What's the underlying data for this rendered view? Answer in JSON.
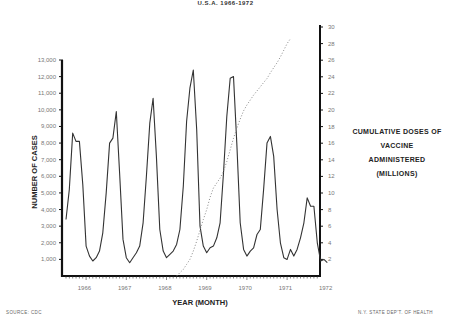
{
  "header": {
    "subtitle": "U.S.A. 1966-1972"
  },
  "footer": {
    "source": "SOURCE: CDC",
    "credit": "N.Y. STATE DEP'T. OF HEALTH"
  },
  "chart_data": {
    "type": "line",
    "title": "U.S.A. 1966-1972",
    "xlabel": "YEAR (MONTH)",
    "ylabel": "NUMBER OF CASES",
    "y2label": "CUMULATIVE DOSES OF VACCINE ADMINISTERED (MILLIONS)",
    "right_title_lines": [
      "CUMULATIVE DOSES OF",
      "VACCINE ADMINISTERED",
      "(MILLIONS)"
    ],
    "ylim": [
      0,
      13000
    ],
    "y2lim": [
      0,
      30
    ],
    "y_ticks": [
      "1,000",
      "2,000",
      "3,000",
      "4,000",
      "5,000",
      "6,000",
      "7,000",
      "8,000",
      "9,000",
      "10,000",
      "11,000",
      "12,000",
      "13,000"
    ],
    "y2_ticks": [
      "2",
      "4",
      "6",
      "8",
      "10",
      "12",
      "14",
      "16",
      "18",
      "20",
      "22",
      "24",
      "26",
      "28",
      "30"
    ],
    "x_tick_labels": [
      "1966",
      "1967",
      "1968",
      "1969",
      "1970",
      "1971",
      "1972"
    ],
    "grid": false,
    "legend": "none",
    "series": [
      {
        "name": "Number of cases (monthly)",
        "axis": "left",
        "style": "solid",
        "x_start": "1966-01",
        "values": [
          3400,
          5200,
          8600,
          8100,
          8100,
          5500,
          1800,
          1200,
          900,
          1100,
          1500,
          2600,
          5000,
          8000,
          8300,
          9900,
          6200,
          2200,
          1100,
          800,
          1100,
          1400,
          1800,
          3200,
          6000,
          9200,
          10700,
          7200,
          2800,
          1500,
          1100,
          1300,
          1500,
          1900,
          2800,
          5400,
          9300,
          11300,
          12400,
          8800,
          3000,
          1800,
          1400,
          1700,
          1800,
          2300,
          3200,
          6200,
          9600,
          11900,
          12000,
          8000,
          3200,
          1600,
          1200,
          1500,
          1700,
          2500,
          2800,
          5200,
          8000,
          8400,
          7200,
          4000,
          2000,
          1100,
          1000,
          1600,
          1200,
          1600,
          2300,
          3200,
          4700,
          4200,
          4200,
          2000,
          900,
          1000,
          800
        ]
      },
      {
        "name": "Cumulative doses of vaccine administered (millions)",
        "axis": "right",
        "style": "dotted",
        "x_start": "1968-10",
        "values": [
          0,
          0.4,
          0.8,
          1.4,
          2.0,
          3.0,
          4.2,
          5.5,
          6.8,
          8.0,
          9.5,
          10.6,
          11.2,
          11.8,
          12.6,
          13.8,
          15.2,
          16.6,
          17.8,
          18.9,
          19.9,
          20.6,
          21.2,
          21.8,
          22.3,
          22.8,
          23.3,
          23.8,
          24.5,
          25.1,
          25.7,
          26.4,
          27.2,
          28.0,
          28.6
        ]
      }
    ]
  }
}
